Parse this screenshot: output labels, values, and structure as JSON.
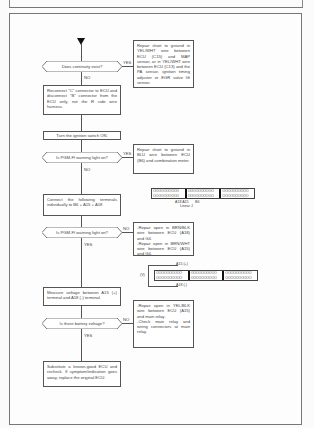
{
  "flowchart": {
    "questions": [
      {
        "text": "Does continuity exist?",
        "yes_label": "YES",
        "no_label": "NO"
      },
      {
        "text": "Is PGM-FI warning light on?",
        "yes_label": "YES",
        "no_label": "NO"
      },
      {
        "text": "Is PGM-FI warning light on?",
        "yes_label": "YES",
        "no_label": "NO"
      },
      {
        "text": "Is there battery voltage?",
        "yes_label": "YES",
        "no_label": "NO"
      }
    ],
    "steps": [
      {
        "text": "Reconnect \"C\" connector to ECU and disconnect \"B\" connector from the ECU only, not the R side wire harness."
      },
      {
        "text": "Turn the ignition switch ON."
      },
      {
        "text": "Connect the following terminals individually to B6 + A15 + A18"
      },
      {
        "text": "Measure voltage between A15 (+) terminal and A18 (-) terminal."
      },
      {
        "text": "Substitute a known-good ECU and recheck. If symptom/indication goes away, replace the original ECU."
      }
    ],
    "repairs": [
      {
        "text": "Repair short to ground in YEL/WHT wire between ECU (C15) and MAP sensor, or in YEL/WHT wire between ECU (C13) and the PA sensor, ignition timing adjuster or EGR valve lift sensor."
      },
      {
        "text": "Repair short to ground in BLU wire between ECU (B6) and combination meter."
      },
      {
        "text": "-Repair open in BRN/BLK wire between ECU (A18) and G4.\n-Repair open in BRN/WHT wire between ECU (A15) and G4."
      },
      {
        "text": "-Repair open in YEL/BLK wire between ECU (A15) and main relay.\n-Check main relay and wiring connectors at main relay."
      }
    ],
    "connectors": [
      {
        "pins_row": "OOOOOOOOOO",
        "labels": [
          "A18 A15",
          "B6",
          "Linear J"
        ]
      },
      {
        "pins_row": "OOOOOOOOOO",
        "labels": [
          "A15 (+)",
          "A18 (-)",
          "(V)"
        ]
      }
    ]
  }
}
